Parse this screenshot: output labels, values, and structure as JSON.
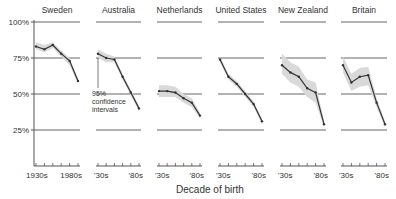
{
  "chart_data": {
    "type": "line",
    "title": "",
    "xlabel": "Decade of birth",
    "ylabel": "",
    "ylim": [
      0,
      100
    ],
    "y_ticks": [
      "100%",
      "75%",
      "50%",
      "25%"
    ],
    "y_tick_values": [
      100,
      75,
      50,
      25
    ],
    "x": [
      "1930s",
      "1940s",
      "1950s",
      "1960s",
      "1970s",
      "1980s"
    ],
    "grid": true,
    "legend": "none",
    "annotation": {
      "text_lines": [
        "95%",
        "confidence",
        "intervals"
      ],
      "panel": "Australia"
    },
    "panels": [
      {
        "name": "Sweden",
        "x_tick_labels": [
          "1930s",
          "1980s"
        ],
        "values": [
          83,
          81,
          84,
          78,
          73,
          59
        ],
        "ci_lower": [
          81,
          79,
          82,
          76,
          70,
          57
        ],
        "ci_upper": [
          86,
          84,
          86,
          80,
          75,
          61
        ]
      },
      {
        "name": "Australia",
        "x_tick_labels": [
          "'30s",
          "'80s"
        ],
        "values": [
          78,
          75,
          74,
          62,
          51,
          40
        ],
        "ci_lower": [
          75,
          72,
          72,
          60,
          49,
          38
        ],
        "ci_upper": [
          81,
          78,
          76,
          64,
          53,
          42
        ]
      },
      {
        "name": "Netherlands",
        "x_tick_labels": [
          "'30s",
          "'80s"
        ],
        "values": [
          52,
          52,
          51,
          47,
          44,
          35
        ],
        "ci_lower": [
          48,
          48,
          48,
          44,
          41,
          33
        ],
        "ci_upper": [
          56,
          56,
          55,
          50,
          47,
          37
        ]
      },
      {
        "name": "United States",
        "x_tick_labels": [
          "'30s",
          "'80s"
        ],
        "values": [
          74,
          62,
          57,
          50,
          43,
          31
        ],
        "ci_lower": [
          72,
          60,
          55,
          48,
          41,
          29
        ],
        "ci_upper": [
          76,
          64,
          59,
          52,
          45,
          33
        ]
      },
      {
        "name": "New Zealand",
        "x_tick_labels": [
          "'30s",
          "'80s"
        ],
        "values": [
          70,
          65,
          62,
          54,
          51,
          29
        ],
        "ci_lower": [
          64,
          58,
          55,
          48,
          44,
          27
        ],
        "ci_upper": [
          78,
          72,
          69,
          60,
          58,
          31
        ]
      },
      {
        "name": "Britain",
        "x_tick_labels": [
          "'30s",
          "'80s"
        ],
        "values": [
          70,
          58,
          62,
          63,
          44,
          29
        ],
        "ci_lower": [
          65,
          52,
          55,
          56,
          41,
          27
        ],
        "ci_upper": [
          76,
          64,
          68,
          69,
          47,
          31
        ]
      }
    ]
  },
  "colors": {
    "line": "#333333",
    "ci_band": "#d9d9d9",
    "grid": "#555555",
    "text": "#333333"
  }
}
